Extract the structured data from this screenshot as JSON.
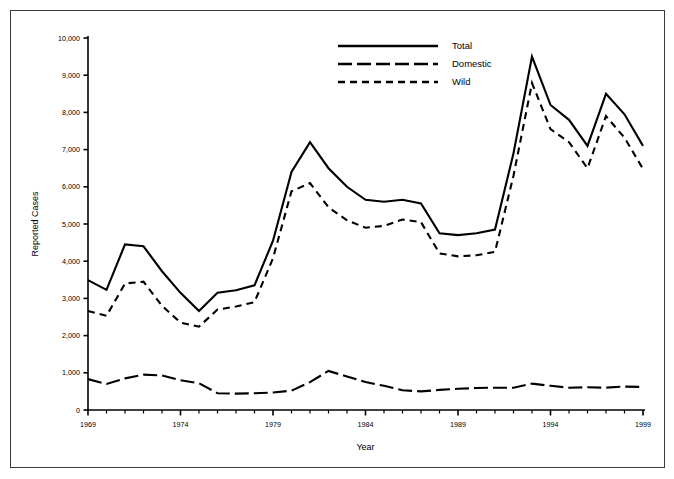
{
  "figure": {
    "frame_border_color": "#3a3a3a",
    "background_color": "#ffffff",
    "line_color": "#000000"
  },
  "axes": {
    "y_title": "Reported Cases",
    "x_title": "Year",
    "y_ticks": [
      "0",
      "1,000",
      "2,000",
      "3,000",
      "4,000",
      "5,000",
      "6,000",
      "7,000",
      "8,000",
      "9,000",
      "10,000"
    ],
    "x_ticks": [
      "1969",
      "1974",
      "1979",
      "1984",
      "1989",
      "1994",
      "1999"
    ]
  },
  "legend": {
    "items": [
      {
        "label": "Total",
        "style": "solid"
      },
      {
        "label": "Domestic",
        "style": "long-dash"
      },
      {
        "label": "Wild",
        "style": "short-dash"
      }
    ]
  },
  "chart_data": {
    "type": "line",
    "title": "",
    "subtitle": "",
    "xlabel": "Year",
    "ylabel": "Reported Cases",
    "xlim": [
      1969,
      1999
    ],
    "ylim": [
      0,
      10000
    ],
    "y_tick_step": 1000,
    "x_tick_step": 1,
    "x_label_step": 5,
    "grid": false,
    "legend_position": "top-center",
    "x": [
      1969,
      1970,
      1971,
      1972,
      1973,
      1974,
      1975,
      1976,
      1977,
      1978,
      1979,
      1980,
      1981,
      1982,
      1983,
      1984,
      1985,
      1986,
      1987,
      1988,
      1989,
      1990,
      1991,
      1992,
      1993,
      1994,
      1995,
      1996,
      1997,
      1998,
      1999
    ],
    "series": [
      {
        "name": "Total",
        "style": "solid",
        "values": [
          3490,
          3230,
          4450,
          4400,
          3730,
          3150,
          2660,
          3150,
          3220,
          3350,
          4550,
          6400,
          7200,
          6500,
          6000,
          5650,
          5600,
          5650,
          5550,
          4750,
          4700,
          4750,
          4850,
          6900,
          9500,
          8200,
          7800,
          7100,
          8500,
          7950,
          7100
        ]
      },
      {
        "name": "Domestic",
        "style": "long-dash",
        "values": [
          830,
          700,
          850,
          950,
          930,
          800,
          720,
          450,
          440,
          450,
          470,
          520,
          750,
          1050,
          900,
          750,
          650,
          530,
          500,
          540,
          570,
          590,
          600,
          600,
          710,
          650,
          600,
          610,
          600,
          630,
          620
        ]
      },
      {
        "name": "Wild",
        "style": "short-dash",
        "values": [
          2660,
          2530,
          3400,
          3450,
          2800,
          2350,
          2240,
          2700,
          2780,
          2900,
          4080,
          5880,
          6100,
          5450,
          5100,
          4900,
          4950,
          5120,
          5050,
          4210,
          4130,
          4160,
          4250,
          6300,
          8790,
          7550,
          7200,
          6500,
          7900,
          7320,
          6480
        ]
      }
    ]
  }
}
